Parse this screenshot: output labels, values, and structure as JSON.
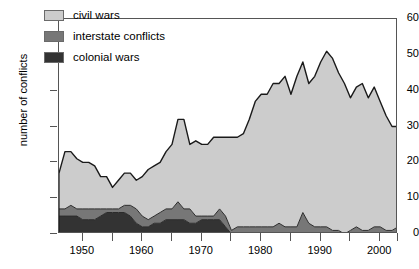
{
  "chart_data": {
    "type": "area",
    "title": "",
    "subtitle": "",
    "xlabel": "",
    "ylabel": "number of conflicts",
    "stacked": true,
    "grid": false,
    "legend_position": "top-left",
    "xlim": [
      1946,
      2003
    ],
    "ylim": [
      0,
      60
    ],
    "x_ticks_major": [
      1950,
      1960,
      1970,
      1980,
      1990,
      2000
    ],
    "x_ticks_minor": [
      1945,
      1955,
      1965,
      1975,
      1985,
      1995,
      2003
    ],
    "y_ticks": [
      0,
      10,
      20,
      30,
      40,
      50,
      60
    ],
    "x": [
      1946,
      1947,
      1948,
      1949,
      1950,
      1951,
      1952,
      1953,
      1954,
      1955,
      1956,
      1957,
      1958,
      1959,
      1960,
      1961,
      1962,
      1963,
      1964,
      1965,
      1966,
      1967,
      1968,
      1969,
      1970,
      1971,
      1972,
      1973,
      1974,
      1975,
      1976,
      1977,
      1978,
      1979,
      1980,
      1981,
      1982,
      1983,
      1984,
      1985,
      1986,
      1987,
      1988,
      1989,
      1990,
      1991,
      1992,
      1993,
      1994,
      1995,
      1996,
      1997,
      1998,
      1999,
      2000,
      2001,
      2002,
      2003
    ],
    "series": [
      {
        "name": "colonial wars",
        "color": "#333333",
        "values": [
          5,
          5,
          5,
          5,
          4,
          4,
          4,
          5,
          6,
          6,
          6,
          6,
          5,
          3,
          2,
          2,
          3,
          3,
          4,
          4,
          4,
          4,
          3,
          3,
          4,
          4,
          4,
          4,
          2,
          0,
          0,
          0,
          0,
          0,
          0,
          0,
          0,
          0,
          0,
          0,
          0,
          0,
          0,
          0,
          0,
          0,
          0,
          0,
          0,
          0,
          0,
          0,
          0,
          0,
          0,
          0,
          0,
          0
        ]
      },
      {
        "name": "interstate conflicts",
        "color": "#777777",
        "values": [
          2,
          2,
          3,
          2,
          3,
          3,
          3,
          2,
          1,
          1,
          1,
          2,
          3,
          4,
          3,
          2,
          2,
          3,
          3,
          3,
          5,
          3,
          4,
          2,
          1,
          1,
          1,
          3,
          3,
          1,
          2,
          2,
          2,
          2,
          2,
          2,
          2,
          3,
          2,
          2,
          2,
          6,
          3,
          2,
          2,
          2,
          1,
          1,
          0,
          1,
          2,
          1,
          1,
          2,
          2,
          1,
          1,
          2
        ]
      },
      {
        "name": "civil wars",
        "color": "#cccccc",
        "values": [
          10,
          16,
          15,
          14,
          13,
          13,
          12,
          9,
          9,
          6,
          8,
          9,
          9,
          8,
          11,
          14,
          14,
          14,
          16,
          18,
          23,
          25,
          18,
          21,
          20,
          20,
          22,
          20,
          22,
          26,
          25,
          26,
          30,
          35,
          37,
          37,
          40,
          39,
          42,
          37,
          42,
          42,
          39,
          42,
          46,
          49,
          48,
          44,
          42,
          37,
          39,
          41,
          37,
          39,
          35,
          32,
          29,
          28
        ]
      }
    ]
  },
  "legend": {
    "items": [
      {
        "label": "civil wars",
        "color": "#cccccc"
      },
      {
        "label": "interstate conflicts",
        "color": "#777777"
      },
      {
        "label": "colonial wars",
        "color": "#333333"
      }
    ]
  },
  "axes": {
    "y_title": "number of conflicts",
    "y_tick_labels": [
      "0",
      "10",
      "20",
      "30",
      "40",
      "50",
      "60"
    ],
    "x_tick_labels": [
      "1950",
      "1960",
      "1970",
      "1980",
      "1990",
      "2000"
    ]
  }
}
